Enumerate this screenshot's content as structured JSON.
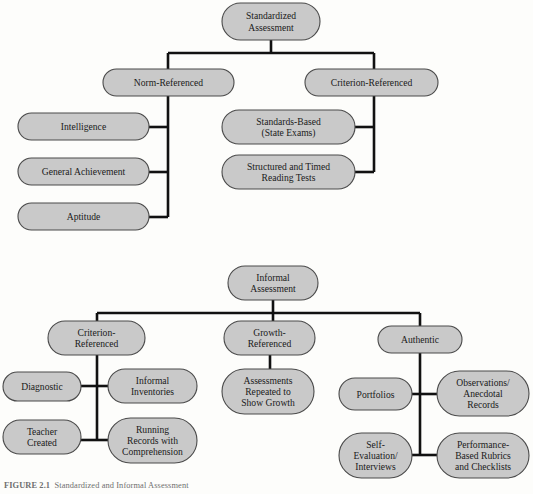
{
  "figure": {
    "background_color": "#fdfdfb",
    "node_fill_color": "#c9c9c9",
    "node_stroke_color": "#4a4a4a",
    "connector_color": "#111111",
    "text_color": "#1a1a1a"
  },
  "caption": {
    "label": "FIGURE 2.1",
    "text": "Standardized and Informal Assessment"
  },
  "diagrams": [
    {
      "name": "standardized-assessment",
      "root": {
        "id": "standardized-assessment",
        "lines": [
          "Standardized",
          "Assessment"
        ],
        "x": 222,
        "y": 3,
        "w": 98,
        "h": 37
      },
      "branches": [
        {
          "id": "norm-referenced",
          "node": {
            "lines": [
              "Norm-Referenced"
            ],
            "x": 103,
            "y": 69,
            "w": 131,
            "h": 27
          },
          "children": [
            {
              "id": "intelligence",
              "lines": [
                "Intelligence"
              ],
              "x": 18,
              "y": 113,
              "w": 131,
              "h": 27
            },
            {
              "id": "general-achievement",
              "lines": [
                "General Achievement"
              ],
              "x": 18,
              "y": 158,
              "w": 131,
              "h": 27
            },
            {
              "id": "aptitude",
              "lines": [
                "Aptitude"
              ],
              "x": 18,
              "y": 203,
              "w": 131,
              "h": 27
            }
          ]
        },
        {
          "id": "criterion-referenced",
          "node": {
            "lines": [
              "Criterion-Referenced"
            ],
            "x": 305,
            "y": 69,
            "w": 133,
            "h": 27
          },
          "children": [
            {
              "id": "standards-based",
              "lines": [
                "Standards-Based",
                "(State Exams)"
              ],
              "x": 222,
              "y": 110,
              "w": 133,
              "h": 34
            },
            {
              "id": "structured-timed-reading-tests",
              "lines": [
                "Structured and Timed",
                "Reading Tests"
              ],
              "x": 222,
              "y": 155,
              "w": 133,
              "h": 34
            }
          ]
        }
      ]
    },
    {
      "name": "informal-assessment",
      "root": {
        "id": "informal-assessment",
        "lines": [
          "Informal",
          "Assessment"
        ],
        "x": 228,
        "y": 266,
        "w": 90,
        "h": 34
      },
      "branches": [
        {
          "id": "criterion-referenced-informal",
          "node": {
            "lines": [
              "Criterion-",
              "Referenced"
            ],
            "x": 48,
            "y": 321,
            "w": 97,
            "h": 34
          },
          "children": [
            {
              "id": "diagnostic",
              "lines": [
                "Diagnostic"
              ],
              "x": 3,
              "y": 372,
              "w": 78,
              "h": 29
            },
            {
              "id": "informal-inventories",
              "lines": [
                "Informal",
                "Inventories"
              ],
              "x": 108,
              "y": 369,
              "w": 89,
              "h": 34
            },
            {
              "id": "teacher-created",
              "lines": [
                "Teacher",
                "Created"
              ],
              "x": 3,
              "y": 420,
              "w": 78,
              "h": 34
            },
            {
              "id": "running-records-with-comprehension",
              "lines": [
                "Running",
                "Records with",
                "Comprehension"
              ],
              "x": 108,
              "y": 418,
              "w": 89,
              "h": 45
            }
          ]
        },
        {
          "id": "growth-referenced",
          "node": {
            "lines": [
              "Growth-",
              "Referenced"
            ],
            "x": 224,
            "y": 321,
            "w": 91,
            "h": 34
          },
          "children": [
            {
              "id": "assessments-repeated-to-show-growth",
              "lines": [
                "Assessments",
                "Repeated to",
                "Show Growth"
              ],
              "x": 222,
              "y": 369,
              "w": 92,
              "h": 45
            }
          ]
        },
        {
          "id": "authentic",
          "node": {
            "lines": [
              "Authentic"
            ],
            "x": 378,
            "y": 326,
            "w": 84,
            "h": 27
          },
          "children": [
            {
              "id": "portfolios",
              "lines": [
                "Portfolios"
              ],
              "x": 339,
              "y": 378,
              "w": 73,
              "h": 32
            },
            {
              "id": "observations-anecdotal-records",
              "lines": [
                "Observations/",
                "Anecdotal",
                "Records"
              ],
              "x": 437,
              "y": 371,
              "w": 92,
              "h": 45
            },
            {
              "id": "self-evaluation-interviews",
              "lines": [
                "Self-",
                "Evaluation/",
                "Interviews"
              ],
              "x": 339,
              "y": 433,
              "w": 73,
              "h": 45
            },
            {
              "id": "performance-based-rubrics-and-checklists",
              "lines": [
                "Performance-",
                "Based Rubrics",
                "and Checklists"
              ],
              "x": 437,
              "y": 433,
              "w": 92,
              "h": 45
            }
          ]
        }
      ]
    }
  ],
  "connectors": {
    "top": [
      "M 271 40 L 271 53",
      "M 168 53 L 374 53",
      "M 168 53 L 168 69",
      "M 374 53 L 374 69",
      "M 168 96 L 168 217",
      "M 149 127 L 168 127",
      "M 149 172 L 168 172",
      "M 149 217 L 168 217",
      "M 374 96 L 374 172",
      "M 355 127 L 374 127",
      "M 355 172 L 374 172"
    ],
    "bottom": [
      "M 273 300 L 273 313",
      "M 97 313 L 420 313",
      "M 97 313 L 97 321",
      "M 273 313 L 273 321",
      "M 420 313 L 420 326",
      "M 97 355 L 97 440",
      "M 81 386 L 108 386",
      "M 81 440 L 108 440",
      "M 270 355 L 270 369",
      "M 420 353 L 420 455",
      "M 412 394 L 437 394",
      "M 412 455 L 437 455"
    ]
  }
}
